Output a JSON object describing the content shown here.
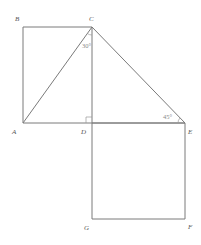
{
  "diagram": {
    "points": {
      "A": {
        "label": "A",
        "x": 23,
        "y": 123
      },
      "B": {
        "label": "B",
        "x": 23,
        "y": 27
      },
      "C": {
        "label": "C",
        "x": 92,
        "y": 27
      },
      "D": {
        "label": "D",
        "x": 92,
        "y": 123
      },
      "E": {
        "label": "E",
        "x": 185,
        "y": 123
      },
      "F": {
        "label": "F",
        "x": 185,
        "y": 219
      },
      "G": {
        "label": "G",
        "x": 92,
        "y": 219
      }
    },
    "angles": {
      "at_C": "30°",
      "at_E": "45°",
      "at_D": "right-angle"
    },
    "colors": {
      "line": "#7a7a7a",
      "label": "#555555",
      "background": "#ffffff"
    }
  }
}
